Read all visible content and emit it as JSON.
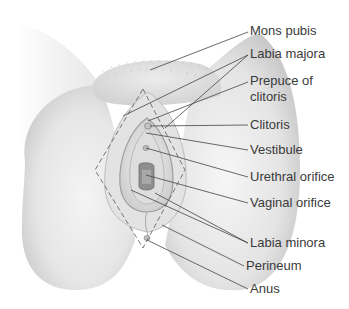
{
  "diagram": {
    "type": "anatomical-illustration",
    "style": "grayscale pencil rendering with dashed diamond outline",
    "colors": {
      "background": "#ffffff",
      "label_text": "#3a3a3a",
      "leader_line": "#444444",
      "skin_light": "#f2f2f2",
      "skin_mid": "#d9d9d9",
      "skin_shadow": "#b5b5b5",
      "dashed_outline": "#666666"
    },
    "labels": [
      {
        "id": "mons-pubis",
        "text": "Mons pubis",
        "x": 250,
        "y": 23,
        "target": [
          150,
          70
        ]
      },
      {
        "id": "labia-majora",
        "text": "Labia majora",
        "x": 250,
        "y": 44,
        "targets": [
          [
            123,
            116
          ],
          [
            165,
            128
          ]
        ]
      },
      {
        "id": "prepuce-of-clitoris",
        "text": "Prepuce of clitoris",
        "line1": "Prepuce of",
        "line2": "clitoris",
        "x": 250,
        "y": 71,
        "target": [
          148,
          136
        ]
      },
      {
        "id": "clitoris",
        "text": "Clitoris",
        "x": 250,
        "y": 117,
        "target": [
          148,
          126
        ]
      },
      {
        "id": "vestibule",
        "text": "Vestibule",
        "x": 250,
        "y": 141,
        "target": [
          146,
          133
        ]
      },
      {
        "id": "urethral-orifice",
        "text": "Urethral orifice",
        "x": 250,
        "y": 168,
        "target": [
          145,
          148
        ]
      },
      {
        "id": "vaginal-orifice",
        "text": "Vaginal orifice",
        "x": 250,
        "y": 194,
        "target": [
          145,
          175
        ]
      },
      {
        "id": "labia-minora",
        "text": "Labia minora",
        "x": 250,
        "y": 234,
        "targets": [
          [
            131,
            190
          ],
          [
            155,
            195
          ]
        ]
      },
      {
        "id": "perineum",
        "text": "Perineum",
        "x": 246,
        "y": 258,
        "target": [
          162,
          225
        ]
      },
      {
        "id": "anus",
        "text": "Anus",
        "x": 250,
        "y": 281,
        "target": [
          146,
          239
        ]
      }
    ]
  }
}
